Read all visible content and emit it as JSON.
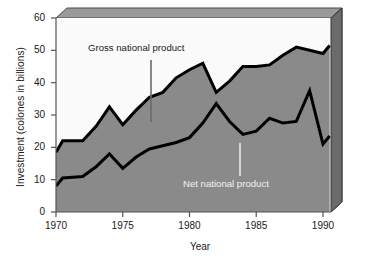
{
  "chart_data": {
    "type": "area",
    "title": "",
    "xlabel": "Year",
    "ylabel": "Investment (colones in billions)",
    "xlim": [
      1970,
      1990.6
    ],
    "ylim": [
      0,
      60
    ],
    "xticks": [
      1970,
      1975,
      1980,
      1985,
      1990
    ],
    "xtick_labels": [
      "1970",
      "1975",
      "1980",
      "1985",
      "1990"
    ],
    "yticks": [
      0,
      10,
      20,
      30,
      40,
      50,
      60
    ],
    "ytick_labels": [
      "0",
      "10",
      "20",
      "30",
      "40",
      "50",
      "60"
    ],
    "grid": false,
    "legend_position": "inline-annotations",
    "style": "3d-stacked-area",
    "x": [
      1970,
      1970.5,
      1971,
      1972,
      1973,
      1974,
      1975,
      1976,
      1977,
      1978,
      1979,
      1980,
      1981,
      1982,
      1983,
      1984,
      1985,
      1986,
      1987,
      1988,
      1989,
      1990,
      1990.5
    ],
    "series": [
      {
        "name": "Gross national product",
        "annotation": "Gross national product",
        "color": "#8a8a8a",
        "line_color": "#000000",
        "values": [
          18.5,
          22.0,
          22.0,
          22.0,
          26.5,
          32.5,
          27.0,
          31.5,
          35.5,
          37.0,
          41.5,
          44.0,
          46.0,
          37.0,
          40.5,
          45.0,
          45.0,
          45.5,
          48.5,
          51.0,
          50.0,
          49.0,
          51.5
        ]
      },
      {
        "name": "Net national product",
        "annotation": "Net national product",
        "color": "#8a8a8a",
        "line_color": "#000000",
        "values": [
          8.0,
          10.5,
          10.7,
          11.0,
          14.0,
          18.0,
          13.5,
          17.0,
          19.5,
          20.5,
          21.5,
          23.0,
          27.5,
          33.5,
          28.0,
          24.0,
          25.0,
          29.0,
          27.5,
          28.0,
          37.5,
          21.0,
          23.5
        ]
      }
    ]
  },
  "axes": {
    "xlabel": "Year",
    "ylabel": "Investment (colones in billions)"
  },
  "annotations": [
    {
      "id": "gnp",
      "text": "Gross national product",
      "color": "#1a1a1a"
    },
    {
      "id": "nnp",
      "text": "Net national product",
      "color": "#f2f2f2"
    }
  ],
  "colors": {
    "band_front": "#8a8a8a",
    "band_side": "#6b6b6b",
    "top_face": "#9a9a9a",
    "plot_background": "#fafafa",
    "axis": "#555555",
    "line": "#000000",
    "text": "#1a1a1a"
  }
}
